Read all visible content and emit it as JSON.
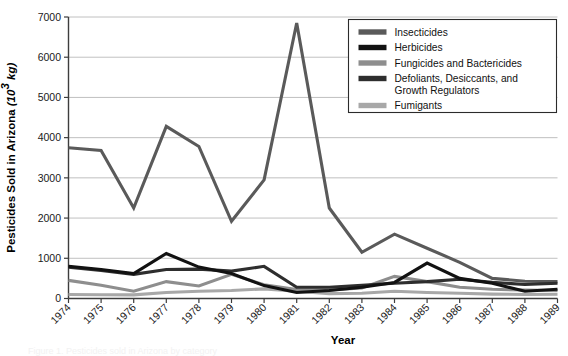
{
  "chart_data": {
    "type": "line",
    "title": "",
    "xlabel": "Year",
    "ylabel": "Pesticides Sold in Arizona (10³ kg)",
    "ylabel_main": "Pesticides Sold in Arizona",
    "ylabel_units": "(10³ kg)",
    "ylabel_units_base": "(10",
    "ylabel_units_sup": "3",
    "ylabel_units_tail": " kg)",
    "xlim": [
      1974,
      1989
    ],
    "ylim": [
      0,
      7000
    ],
    "grid": "horizontal",
    "legend_position": "top-right",
    "categories": [
      1974,
      1975,
      1976,
      1977,
      1978,
      1979,
      1980,
      1981,
      1982,
      1983,
      1984,
      1985,
      1986,
      1987,
      1988,
      1989
    ],
    "x": [
      "1974",
      "1975",
      "1976",
      "1977",
      "1978",
      "1979",
      "1980",
      "1981",
      "1982",
      "1983",
      "1984",
      "1985",
      "1986",
      "1987",
      "1988",
      "1989"
    ],
    "ytick_labels": [
      "0",
      "1000",
      "2000",
      "3000",
      "4000",
      "5000",
      "6000",
      "7000"
    ],
    "ytick_values": [
      0,
      1000,
      2000,
      3000,
      4000,
      5000,
      6000,
      7000
    ],
    "series": [
      {
        "name": "Insecticides",
        "color": "#5a5a5a",
        "values": [
          3750,
          3680,
          2250,
          4280,
          3780,
          1920,
          2950,
          6850,
          2250,
          1150,
          1600,
          1250,
          900,
          500,
          430,
          420
        ]
      },
      {
        "name": "Herbicides",
        "color": "#121212",
        "values": [
          800,
          720,
          620,
          1120,
          780,
          620,
          320,
          150,
          200,
          280,
          400,
          880,
          500,
          380,
          180,
          230
        ]
      },
      {
        "name": "Fungicides and Bactericides",
        "color": "#8e8e8e",
        "values": [
          450,
          330,
          180,
          420,
          310,
          600,
          340,
          220,
          210,
          260,
          550,
          420,
          280,
          230,
          210,
          200
        ]
      },
      {
        "name": "Defoliants, Desiccants, and Growth Regulators",
        "color": "#2e2e2e",
        "values": [
          780,
          700,
          600,
          720,
          730,
          680,
          800,
          280,
          280,
          330,
          380,
          420,
          480,
          400,
          350,
          380
        ]
      },
      {
        "name": "Fumigants",
        "color": "#a8a8a8",
        "values": [
          100,
          95,
          90,
          150,
          180,
          200,
          240,
          180,
          120,
          130,
          180,
          150,
          130,
          110,
          100,
          105
        ]
      }
    ]
  },
  "legend": {
    "entries": [
      {
        "label": "Insecticides",
        "label2": "",
        "color": "#5a5a5a"
      },
      {
        "label": "Herbicides",
        "label2": "",
        "color": "#121212"
      },
      {
        "label": "Fungicides and Bactericides",
        "label2": "",
        "color": "#8e8e8e"
      },
      {
        "label": "Defoliants, Desiccants, and",
        "label2": "Growth Regulators",
        "color": "#2e2e2e"
      },
      {
        "label": "Fumigants",
        "label2": "",
        "color": "#a8a8a8"
      }
    ]
  },
  "caption": {
    "ghost_text": "Figure 1. Pesticides sold in Arizona by category"
  }
}
